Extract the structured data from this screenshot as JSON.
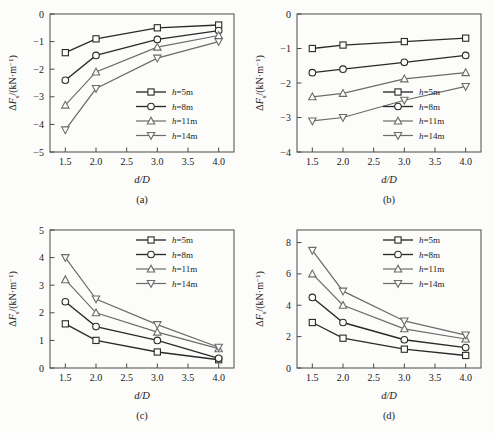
{
  "figure": {
    "background_color": "#fcfcfa",
    "line_color": "#2a2a2a",
    "light_line_color": "#6b6b6b",
    "axis_label_x": "d/D",
    "y_label_delta": "Δ",
    "y_label_symbol": "F",
    "y_label_subscript": "s",
    "y_label_unit": "/(kN·m",
    "y_label_unit_sup": "−1",
    "y_label_unit_close": ")"
  },
  "legend": {
    "entries": [
      {
        "label_prefix": "h",
        "label_value": "=5m",
        "marker": "square-marker"
      },
      {
        "label_prefix": "h",
        "label_value": "=8m",
        "marker": "circle-marker"
      },
      {
        "label_prefix": "h",
        "label_value": "=11m",
        "marker": "triangle-up-marker"
      },
      {
        "label_prefix": "h",
        "label_value": "=14m",
        "marker": "triangle-down-marker"
      }
    ]
  },
  "chart_data": [
    {
      "type": "line",
      "panel": "(a)",
      "title": "",
      "xlabel": "d/D",
      "ylabel": "ΔFs/(kN·m⁻¹)",
      "x": [
        1.5,
        2.0,
        3.0,
        4.0
      ],
      "xlim": [
        1.25,
        4.25
      ],
      "xticks": [
        1.5,
        2.0,
        2.5,
        3.0,
        3.5,
        4.0
      ],
      "xticklabels": [
        "1.5",
        "2.0",
        "2.5",
        "3.0",
        "3.5",
        "4.0"
      ],
      "ylim": [
        -5,
        0
      ],
      "yticks": [
        -5,
        -4,
        -3,
        -2,
        -1,
        0
      ],
      "yticklabels": [
        "−5",
        "−4",
        "−3",
        "−2",
        "−1",
        "0"
      ],
      "grid": false,
      "legend_position": "lower-right",
      "series": [
        {
          "name": "h=5m",
          "marker": "square",
          "values": [
            -1.4,
            -0.9,
            -0.5,
            -0.4
          ]
        },
        {
          "name": "h=8m",
          "marker": "circle",
          "values": [
            -2.4,
            -1.5,
            -0.92,
            -0.6
          ]
        },
        {
          "name": "h=11m",
          "marker": "triangle-up",
          "values": [
            -3.3,
            -2.1,
            -1.2,
            -0.78
          ]
        },
        {
          "name": "h=14m",
          "marker": "triangle-down",
          "values": [
            -4.2,
            -2.7,
            -1.6,
            -1.0
          ]
        }
      ]
    },
    {
      "type": "line",
      "panel": "(b)",
      "title": "",
      "xlabel": "d/D",
      "ylabel": "ΔFs/(kN·m⁻¹)",
      "x": [
        1.5,
        2.0,
        3.0,
        4.0
      ],
      "xlim": [
        1.25,
        4.25
      ],
      "xticks": [
        1.5,
        2.0,
        2.5,
        3.0,
        3.5,
        4.0
      ],
      "xticklabels": [
        "1.5",
        "2.0",
        "2.5",
        "3.0",
        "3.5",
        "4.0"
      ],
      "ylim": [
        -4,
        0
      ],
      "yticks": [
        -4,
        -3,
        -2,
        -1,
        0
      ],
      "yticklabels": [
        "−4",
        "−3",
        "−2",
        "−1",
        "0"
      ],
      "grid": false,
      "legend_position": "lower-right",
      "series": [
        {
          "name": "h=5m",
          "marker": "square",
          "values": [
            -1.0,
            -0.9,
            -0.8,
            -0.7
          ]
        },
        {
          "name": "h=8m",
          "marker": "circle",
          "values": [
            -1.7,
            -1.6,
            -1.4,
            -1.2
          ]
        },
        {
          "name": "h=11m",
          "marker": "triangle-up",
          "values": [
            -2.4,
            -2.3,
            -1.88,
            -1.7
          ]
        },
        {
          "name": "h=14m",
          "marker": "triangle-down",
          "values": [
            -3.1,
            -3.0,
            -2.5,
            -2.1
          ]
        }
      ]
    },
    {
      "type": "line",
      "panel": "(c)",
      "title": "",
      "xlabel": "d/D",
      "ylabel": "ΔFs/(kN·m⁻¹)",
      "x": [
        1.5,
        2.0,
        3.0,
        4.0
      ],
      "xlim": [
        1.25,
        4.25
      ],
      "xticks": [
        1.5,
        2.0,
        2.5,
        3.0,
        3.5,
        4.0
      ],
      "xticklabels": [
        "1.5",
        "2.0",
        "2.5",
        "3.0",
        "3.5",
        "4.0"
      ],
      "ylim": [
        0,
        5
      ],
      "yticks": [
        0,
        1,
        2,
        3,
        4,
        5
      ],
      "yticklabels": [
        "0",
        "1",
        "2",
        "3",
        "4",
        "5"
      ],
      "grid": false,
      "legend_position": "upper-right",
      "series": [
        {
          "name": "h=5m",
          "marker": "square",
          "values": [
            1.6,
            1.0,
            0.58,
            0.3
          ]
        },
        {
          "name": "h=8m",
          "marker": "circle",
          "values": [
            2.4,
            1.5,
            1.0,
            0.35
          ]
        },
        {
          "name": "h=11m",
          "marker": "triangle-up",
          "values": [
            3.2,
            2.0,
            1.3,
            0.7
          ]
        },
        {
          "name": "h=14m",
          "marker": "triangle-down",
          "values": [
            4.0,
            2.5,
            1.57,
            0.75
          ]
        }
      ]
    },
    {
      "type": "line",
      "panel": "(d)",
      "title": "",
      "xlabel": "d/D",
      "ylabel": "ΔFs/(kN·m⁻¹)",
      "x": [
        1.5,
        2.0,
        3.0,
        4.0
      ],
      "xlim": [
        1.25,
        4.25
      ],
      "xticks": [
        1.5,
        2.0,
        2.5,
        3.0,
        3.5,
        4.0
      ],
      "xticklabels": [
        "1.5",
        "2.0",
        "2.5",
        "3.0",
        "3.5",
        "4.0"
      ],
      "ylim": [
        0,
        8.8
      ],
      "yticks": [
        0,
        2,
        4,
        6,
        8
      ],
      "yticklabels": [
        "0",
        "2",
        "4",
        "6",
        "8"
      ],
      "grid": false,
      "legend_position": "upper-right",
      "series": [
        {
          "name": "h=5m",
          "marker": "square",
          "values": [
            2.9,
            1.9,
            1.2,
            0.8
          ]
        },
        {
          "name": "h=8m",
          "marker": "circle",
          "values": [
            4.5,
            2.9,
            1.8,
            1.3
          ]
        },
        {
          "name": "h=11m",
          "marker": "triangle-up",
          "values": [
            6.0,
            4.0,
            2.5,
            1.85
          ]
        },
        {
          "name": "h=14m",
          "marker": "triangle-down",
          "values": [
            7.5,
            4.9,
            3.0,
            2.1
          ]
        }
      ]
    }
  ]
}
